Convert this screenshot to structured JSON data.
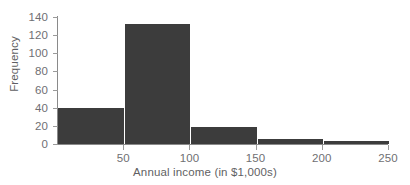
{
  "figure": {
    "background_color": "#ffffff",
    "bar_color": "#3c3c3c",
    "axis_color": "#8a8a8a",
    "label_color": "#6f6f73",
    "title_color": "#5f5f63",
    "cropped_header_ghost": ""
  },
  "chart_data": {
    "type": "bar",
    "title": "",
    "subtitle": "",
    "xlabel": "Annual income (in $1,000s)",
    "ylabel": "Frequency",
    "categories": [
      "0-50",
      "50-100",
      "100-150",
      "150-200",
      "200-250"
    ],
    "bin_edges": [
      0,
      50,
      100,
      150,
      200,
      250
    ],
    "bin_width": 50,
    "values": [
      40,
      132,
      19,
      6,
      3
    ],
    "series": [
      {
        "name": "Frequency",
        "values": [
          40,
          132,
          19,
          6,
          3
        ]
      }
    ],
    "xlim": [
      0,
      250
    ],
    "ylim": [
      0,
      140
    ],
    "xticks": [
      50,
      100,
      150,
      200,
      250
    ],
    "xticklabels": [
      "50",
      "100",
      "150",
      "200",
      "250"
    ],
    "yticks": [
      0,
      20,
      40,
      60,
      80,
      100,
      120,
      140
    ],
    "yticklabels": [
      "0",
      "20",
      "40",
      "60",
      "80",
      "100",
      "120",
      "140"
    ],
    "grid": false,
    "legend": false,
    "legend_position": "none",
    "annotations": []
  }
}
